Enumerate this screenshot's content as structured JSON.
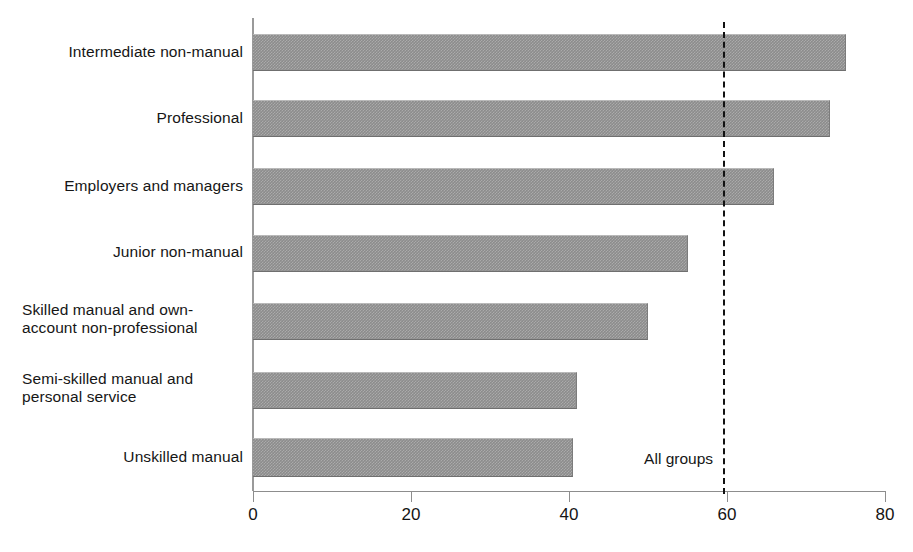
{
  "chart_data": {
    "type": "bar",
    "orientation": "horizontal",
    "title": "",
    "subtitle": "",
    "xlabel": "",
    "ylabel": "",
    "xlim": [
      0,
      80
    ],
    "ylim": null,
    "grid": false,
    "legend": null,
    "xticks": [
      0,
      20,
      40,
      60,
      80
    ],
    "xtick_labels": [
      "0",
      "20",
      "40",
      "60",
      "80"
    ],
    "categories": [
      "Intermediate non-manual",
      "Professional",
      "Employers and managers",
      "Junior non-manual",
      "Skilled manual and own-\naccount non-professional",
      "Semi-skilled manual and\npersonal service",
      "Unskilled manual"
    ],
    "values": [
      75,
      73,
      66,
      55,
      50,
      41,
      40.5
    ],
    "bar_color": "#8c8c8c",
    "annotations": [
      {
        "text": "All groups",
        "type": "reference-line",
        "value": 59.5,
        "style": "dashed",
        "color": "#111111"
      }
    ]
  },
  "axis": {
    "tick_0": "0",
    "tick_1": "20",
    "tick_2": "40",
    "tick_3": "60",
    "tick_4": "80"
  },
  "labels": {
    "cat_0": "Intermediate non-manual",
    "cat_1": "Professional",
    "cat_2": "Employers and managers",
    "cat_3": "Junior non-manual",
    "cat_4": "Skilled manual and own-\naccount non-professional",
    "cat_5": "Semi-skilled manual and\npersonal service",
    "cat_6": "Unskilled manual",
    "all_groups": "All groups"
  }
}
